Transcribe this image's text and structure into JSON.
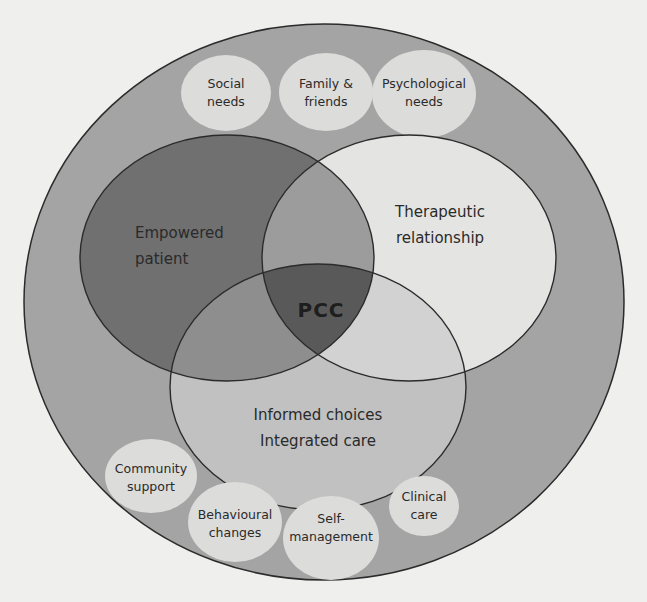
{
  "diagram": {
    "colors": {
      "background": "#efefed",
      "outer_ring": "#a4a4a4",
      "empowered": "#707070",
      "therapeutic": "#e4e4e2",
      "informed": "#c1c1c1",
      "empowered_therapeutic": "#9c9c9c",
      "empowered_informed": "#8e8e8e",
      "therapeutic_informed": "#d2d2d2",
      "center": "#595959",
      "satellite": "#dcdcdb",
      "stroke": "#2b2b2b"
    },
    "center_label": "PCC",
    "main_circles": [
      {
        "id": "empowered",
        "lines": [
          "Empowered",
          "patient"
        ]
      },
      {
        "id": "therapeutic",
        "lines": [
          "Therapeutic",
          "relationship"
        ]
      },
      {
        "id": "informed",
        "lines": [
          "Informed choices",
          "Integrated care"
        ]
      }
    ],
    "satellites": [
      {
        "id": "social",
        "lines": [
          "Social",
          "needs"
        ]
      },
      {
        "id": "family",
        "lines": [
          "Family &",
          "friends"
        ]
      },
      {
        "id": "psychological",
        "lines": [
          "Psychological",
          "needs"
        ]
      },
      {
        "id": "community",
        "lines": [
          "Community",
          "support"
        ]
      },
      {
        "id": "behavioural",
        "lines": [
          "Behavioural",
          "changes"
        ]
      },
      {
        "id": "self",
        "lines": [
          "Self-",
          "management"
        ]
      },
      {
        "id": "clinical",
        "lines": [
          "Clinical",
          "care"
        ]
      }
    ]
  }
}
